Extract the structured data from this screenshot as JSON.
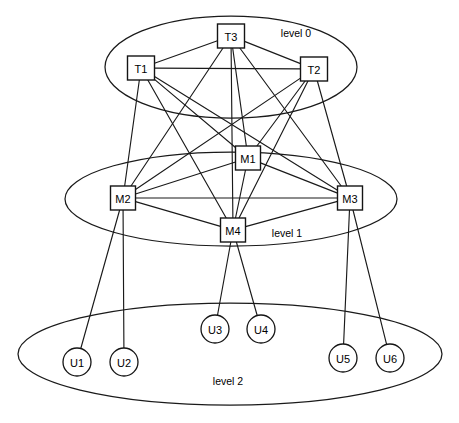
{
  "diagram": {
    "canvas": {
      "width": 459,
      "height": 423
    },
    "colors": {
      "stroke": "#1a1a1a",
      "node_fill": "#ffffff",
      "background": "#ffffff",
      "text": "#000000"
    },
    "levels": [
      {
        "id": "level-0",
        "label": "level 0",
        "label_x": 296,
        "label_y": 33,
        "ellipse": {
          "cx": 231,
          "cy": 67,
          "rx": 126,
          "ry": 51
        }
      },
      {
        "id": "level-1",
        "label": "level 1",
        "label_x": 287,
        "label_y": 233,
        "ellipse": {
          "cx": 231,
          "cy": 199,
          "rx": 166,
          "ry": 47
        }
      },
      {
        "id": "level-2",
        "label": "level 2",
        "label_x": 228,
        "label_y": 381,
        "ellipse": {
          "cx": 230,
          "cy": 354,
          "rx": 212,
          "ry": 51
        }
      }
    ],
    "nodes": [
      {
        "id": "T1",
        "label": "T1",
        "shape": "square",
        "level": 0,
        "x": 141,
        "y": 68,
        "w": 27,
        "h": 24
      },
      {
        "id": "T2",
        "label": "T2",
        "shape": "square",
        "level": 0,
        "x": 314,
        "y": 69,
        "w": 27,
        "h": 24
      },
      {
        "id": "T3",
        "label": "T3",
        "shape": "square",
        "level": 0,
        "x": 231,
        "y": 36,
        "w": 27,
        "h": 24
      },
      {
        "id": "M1",
        "label": "M1",
        "shape": "square",
        "level": 1,
        "x": 248,
        "y": 158,
        "w": 25,
        "h": 24
      },
      {
        "id": "M2",
        "label": "M2",
        "shape": "square",
        "level": 1,
        "x": 123,
        "y": 198,
        "w": 25,
        "h": 24
      },
      {
        "id": "M3",
        "label": "M3",
        "shape": "square",
        "level": 1,
        "x": 350,
        "y": 198,
        "w": 25,
        "h": 24
      },
      {
        "id": "M4",
        "label": "M4",
        "shape": "square",
        "level": 1,
        "x": 233,
        "y": 230,
        "w": 25,
        "h": 24
      },
      {
        "id": "U1",
        "label": "U1",
        "shape": "circle",
        "level": 2,
        "x": 77,
        "y": 362,
        "r": 14
      },
      {
        "id": "U2",
        "label": "U2",
        "shape": "circle",
        "level": 2,
        "x": 124,
        "y": 362,
        "r": 14
      },
      {
        "id": "U3",
        "label": "U3",
        "shape": "circle",
        "level": 2,
        "x": 215,
        "y": 329,
        "r": 14
      },
      {
        "id": "U4",
        "label": "U4",
        "shape": "circle",
        "level": 2,
        "x": 261,
        "y": 329,
        "r": 14
      },
      {
        "id": "U5",
        "label": "U5",
        "shape": "circle",
        "level": 2,
        "x": 343,
        "y": 358,
        "r": 14
      },
      {
        "id": "U6",
        "label": "U6",
        "shape": "circle",
        "level": 2,
        "x": 390,
        "y": 358,
        "r": 14
      }
    ],
    "edges": [
      {
        "from": "T1",
        "to": "T2"
      },
      {
        "from": "T1",
        "to": "T3"
      },
      {
        "from": "T2",
        "to": "T3"
      },
      {
        "from": "T1",
        "to": "M1"
      },
      {
        "from": "T1",
        "to": "M2"
      },
      {
        "from": "T1",
        "to": "M3"
      },
      {
        "from": "T1",
        "to": "M4"
      },
      {
        "from": "T2",
        "to": "M1"
      },
      {
        "from": "T2",
        "to": "M2"
      },
      {
        "from": "T2",
        "to": "M3"
      },
      {
        "from": "T2",
        "to": "M4"
      },
      {
        "from": "T3",
        "to": "M1"
      },
      {
        "from": "T3",
        "to": "M2"
      },
      {
        "from": "T3",
        "to": "M3"
      },
      {
        "from": "T3",
        "to": "M4"
      },
      {
        "from": "M1",
        "to": "M2"
      },
      {
        "from": "M1",
        "to": "M3"
      },
      {
        "from": "M1",
        "to": "M4"
      },
      {
        "from": "M2",
        "to": "M3"
      },
      {
        "from": "M2",
        "to": "M4"
      },
      {
        "from": "M3",
        "to": "M4"
      },
      {
        "from": "M2",
        "to": "U1"
      },
      {
        "from": "M2",
        "to": "U2"
      },
      {
        "from": "M4",
        "to": "U3"
      },
      {
        "from": "M4",
        "to": "U4"
      },
      {
        "from": "M3",
        "to": "U5"
      },
      {
        "from": "M3",
        "to": "U6"
      }
    ]
  }
}
